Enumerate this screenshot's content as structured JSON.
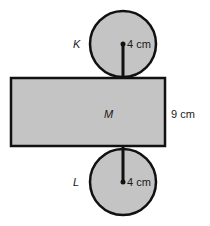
{
  "diagram": {
    "type": "cylinder-net",
    "fill_color": "#c4c4c4",
    "stroke_color": "#111111",
    "top_circle": {
      "label": "K",
      "radius_label": "4 cm"
    },
    "rectangle": {
      "label": "M",
      "height_label": "9 cm"
    },
    "bottom_circle": {
      "label": "L",
      "radius_label": "4 cm"
    }
  }
}
